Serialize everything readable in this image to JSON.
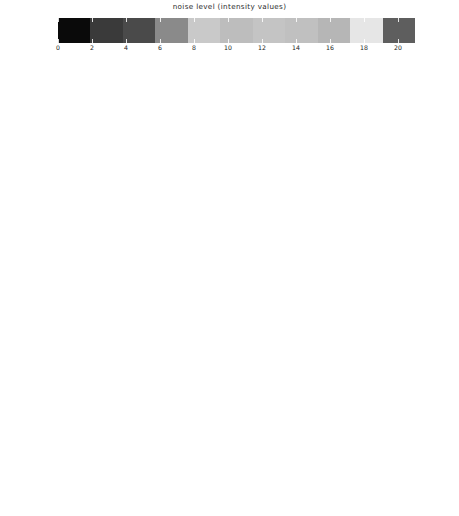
{
  "figure": {
    "background": "#ffffff",
    "axis_color": "#1a1a1a"
  },
  "colorbar": {
    "title": "noise level (intensity values)",
    "vmin": 0,
    "vmax": 21,
    "tick_labels": [
      "0",
      "2",
      "4",
      "6",
      "8",
      "10",
      "12",
      "14",
      "16",
      "18",
      "20"
    ],
    "tick_values": [
      0,
      2,
      4,
      6,
      8,
      10,
      12,
      14,
      16,
      18,
      20
    ],
    "band_count": 11,
    "band_colors": [
      "#0a0a0a",
      "#3a3a3a",
      "#4a4a4a",
      "#8a8a8a",
      "#c9c9c9",
      "#bdbdbd",
      "#c4c4c4",
      "#c0c0c0",
      "#b6b6b6",
      "#e6e6e6",
      "#5e5e5e"
    ],
    "band_edge_color": "#1f1f1f"
  },
  "axes_common": {
    "xlabel": "error [px]",
    "ylabel": "counts [norm.]",
    "xlim": [
      -0.155,
      0.155
    ],
    "xtick_labels": [
      "-0.1",
      "0.0",
      "0.1"
    ],
    "xtick_values": [
      -0.1,
      0.0,
      0.1
    ]
  },
  "chart_data": {
    "type": "line",
    "title": "noise level (intensity values)",
    "xlabel": "error [px]",
    "ylabel": "counts [norm.]",
    "xlim": [
      -0.155,
      0.155
    ],
    "grid": false,
    "legend": "colorbar",
    "legend_position": "top",
    "series_colors": [
      "#111111",
      "#2b2b2b",
      "#3d3d3d",
      "#555555",
      "#6b6b6b",
      "#808080",
      "#949494",
      "#a6a6a6",
      "#b5b5b5",
      "#c6c6c6",
      "#8d8d8d"
    ],
    "series_noise_levels": [
      0,
      2,
      4,
      6,
      8,
      10,
      12,
      14,
      16,
      18,
      20
    ],
    "panels": [
      {
        "tag": "(a)",
        "ng_label": "N",
        "ng_sub": "g",
        "ng_value": "=2",
        "ylim": [
          0,
          20
        ],
        "ytick_labels": [
          "0",
          "5",
          "10",
          "15",
          "20"
        ],
        "ytick_values": [
          0,
          5,
          10,
          15,
          20
        ],
        "peaks": [
          18.0,
          12.2,
          11.3,
          10.6,
          10.2,
          10.0,
          9.8,
          9.6,
          9.5,
          9.4,
          9.3
        ],
        "widths": [
          0.022,
          0.028,
          0.03,
          0.031,
          0.032,
          0.032,
          0.033,
          0.033,
          0.034,
          0.034,
          0.035
        ]
      },
      {
        "tag": "(b)",
        "ng_label": "N",
        "ng_sub": "g",
        "ng_value": "=3",
        "ylim": [
          0,
          30
        ],
        "ytick_labels": [
          "0",
          "5",
          "10",
          "15",
          "20",
          "25",
          "30"
        ],
        "ytick_values": [
          0,
          5,
          10,
          15,
          20,
          25,
          30
        ],
        "peaks": [
          28.5,
          21.5,
          14.0,
          11.0,
          9.5,
          8.6,
          8.0,
          7.6,
          7.3,
          7.0,
          6.8
        ],
        "widths": [
          0.012,
          0.017,
          0.025,
          0.031,
          0.036,
          0.039,
          0.042,
          0.044,
          0.046,
          0.048,
          0.049
        ]
      },
      {
        "tag": "(c)",
        "ng_label": "N",
        "ng_sub": "g",
        "ng_value": "=4",
        "ylim": [
          0,
          40
        ],
        "ytick_labels": [
          "0",
          "10",
          "20",
          "30",
          "40"
        ],
        "ytick_values": [
          0,
          10,
          20,
          30,
          40
        ],
        "peaks": [
          38.0,
          22.0,
          14.5,
          11.0,
          9.2,
          8.2,
          7.5,
          7.0,
          6.7,
          6.4,
          6.2
        ],
        "widths": [
          0.01,
          0.018,
          0.026,
          0.033,
          0.039,
          0.043,
          0.046,
          0.049,
          0.051,
          0.053,
          0.055
        ]
      },
      {
        "tag": "(d)",
        "ng_label": "N",
        "ng_sub": "g",
        "ng_value": "=5",
        "ylim": [
          0,
          50
        ],
        "ytick_labels": [
          "0",
          "10",
          "20",
          "30",
          "40",
          "50"
        ],
        "ytick_values": [
          0,
          10,
          20,
          30,
          40,
          50
        ],
        "peaks": [
          42.0,
          40.0,
          17.5,
          16.0,
          11.0,
          9.5,
          8.0,
          7.2,
          6.6,
          6.2,
          5.9
        ],
        "widths": [
          0.01,
          0.011,
          0.024,
          0.027,
          0.036,
          0.041,
          0.047,
          0.051,
          0.054,
          0.057,
          0.059
        ]
      },
      {
        "tag": "(e)",
        "ng_label": "N",
        "ng_sub": "g",
        "ng_value": "=6",
        "ylim": [
          0,
          60
        ],
        "ytick_labels": [
          "0",
          "10",
          "20",
          "30",
          "40",
          "50",
          "60"
        ],
        "ytick_values": [
          0,
          10,
          20,
          30,
          40,
          50,
          60
        ],
        "peaks": [
          52.0,
          41.0,
          22.0,
          16.5,
          12.0,
          9.5,
          8.2,
          7.3,
          6.7,
          6.2,
          5.9
        ],
        "widths": [
          0.009,
          0.011,
          0.02,
          0.027,
          0.035,
          0.042,
          0.048,
          0.052,
          0.056,
          0.059,
          0.061
        ]
      },
      {
        "tag": "(f)",
        "ng_label": "N",
        "ng_sub": "g",
        "ng_value": "=7",
        "ylim": [
          0,
          100
        ],
        "ytick_labels": [
          "0",
          "20",
          "40",
          "60",
          "80",
          "100"
        ],
        "ytick_values": [
          0,
          20,
          40,
          60,
          80,
          100
        ],
        "peaks": [
          80.0,
          27.0,
          25.0,
          21.0,
          14.0,
          10.5,
          8.5,
          7.4,
          6.7,
          6.2,
          5.8
        ],
        "widths": [
          0.006,
          0.017,
          0.018,
          0.022,
          0.031,
          0.04,
          0.048,
          0.054,
          0.058,
          0.062,
          0.065
        ]
      },
      {
        "tag": "(g)",
        "ng_label": "N",
        "ng_sub": "g",
        "ng_value": "=8",
        "ylim": [
          0,
          80
        ],
        "ytick_labels": [
          "0",
          "20",
          "40",
          "60",
          "80"
        ],
        "ytick_values": [
          0,
          20,
          40,
          60,
          80
        ],
        "peaks": [
          72.0,
          54.0,
          21.0,
          17.0,
          12.0,
          9.2,
          7.8,
          7.0,
          6.4,
          6.0,
          5.7
        ],
        "widths": [
          0.006,
          0.008,
          0.02,
          0.026,
          0.035,
          0.044,
          0.051,
          0.056,
          0.06,
          0.063,
          0.066
        ]
      },
      {
        "tag": "(h)",
        "ng_label": "N",
        "ng_sub": "g",
        "ng_value": "=9",
        "ylim": [
          0,
          80
        ],
        "ytick_labels": [
          "0",
          "20",
          "40",
          "60",
          "80"
        ],
        "ytick_values": [
          0,
          20,
          40,
          60,
          80
        ],
        "peaks": [
          78.0,
          63.0,
          24.0,
          19.0,
          12.5,
          9.4,
          7.9,
          7.0,
          6.4,
          6.0,
          5.7
        ],
        "widths": [
          0.005,
          0.007,
          0.018,
          0.024,
          0.034,
          0.043,
          0.05,
          0.056,
          0.06,
          0.063,
          0.066
        ]
      },
      {
        "tag": "(i)",
        "ng_label": "N",
        "ng_sub": "g",
        "ng_value": "=10",
        "ylim": [
          0,
          80
        ],
        "ytick_labels": [
          "0",
          "20",
          "40",
          "60",
          "80"
        ],
        "ytick_values": [
          0,
          20,
          40,
          60,
          80
        ],
        "peaks": [
          73.0,
          28.0,
          21.0,
          18.0,
          13.0,
          9.6,
          8.0,
          7.0,
          6.4,
          6.0,
          5.7
        ],
        "widths": [
          0.005,
          0.016,
          0.021,
          0.025,
          0.033,
          0.042,
          0.05,
          0.056,
          0.06,
          0.063,
          0.066
        ]
      },
      {
        "tag": "(j)",
        "ng_label": "N",
        "ng_sub": "g",
        "ng_value": "=11",
        "ylim": [
          0,
          100
        ],
        "ytick_labels": [
          "0",
          "20",
          "40",
          "60",
          "80",
          "100"
        ],
        "ytick_values": [
          0,
          20,
          40,
          60,
          80,
          100
        ],
        "peaks": [
          98.0,
          38.0,
          22.0,
          17.0,
          12.0,
          9.0,
          7.6,
          6.8,
          6.2,
          5.8,
          5.5
        ],
        "widths": [
          0.004,
          0.013,
          0.02,
          0.026,
          0.035,
          0.045,
          0.052,
          0.058,
          0.062,
          0.065,
          0.068
        ]
      }
    ]
  }
}
